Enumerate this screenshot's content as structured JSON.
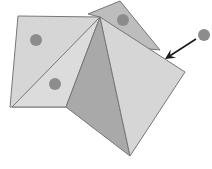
{
  "diagram": {
    "title": "",
    "colors": {
      "background": "#ffffff",
      "face_light": "#d6d6d6",
      "face_lighter": "#dcdcdc",
      "face_mid": "#bdbdbd",
      "face_dark": "#a9a9a9",
      "stroke": "#777777",
      "dot": "#8c8c8c",
      "arrow": "#1a1a1a"
    },
    "faces": [
      {
        "id": "back-square",
        "points": "88,14 120,1 160,50 140,48 100,17"
      },
      {
        "id": "left-square",
        "points": "18,16 100,17 66,107 10,107"
      },
      {
        "id": "left-triangle",
        "points": "100,17 66,107 12,107"
      },
      {
        "id": "front-left-face",
        "points": "100,17 66,107 130,156"
      },
      {
        "id": "front-right-face",
        "points": "100,17 185,72 130,156"
      }
    ],
    "dots": [
      {
        "id": "dot-left-square",
        "cx": 36,
        "cy": 40,
        "r": 6
      },
      {
        "id": "dot-left-triangle",
        "cx": 55,
        "cy": 84,
        "r": 6
      },
      {
        "id": "dot-back-square",
        "cx": 123,
        "cy": 20,
        "r": 6
      },
      {
        "id": "dot-outside",
        "cx": 204,
        "cy": 35,
        "r": 6
      }
    ],
    "arrow": {
      "from": [
        196,
        39
      ],
      "to": [
        165,
        59
      ]
    }
  }
}
